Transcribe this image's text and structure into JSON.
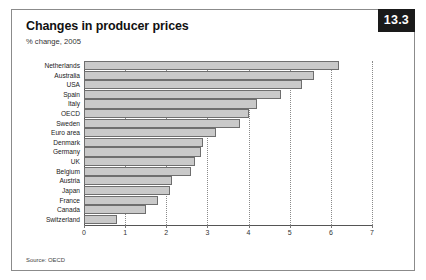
{
  "badge": {
    "label": "13.3"
  },
  "header": {
    "title": "Changes in producer prices",
    "subtitle": "% change, 2005"
  },
  "footer": {
    "source": "Source: OECD"
  },
  "chart_data": {
    "type": "bar",
    "orientation": "horizontal",
    "title": "Changes in producer prices",
    "subtitle": "% change, 2005",
    "xlabel": "",
    "ylabel": "",
    "xlim": [
      0,
      7
    ],
    "xticks": [
      0,
      1,
      2,
      3,
      4,
      5,
      6,
      7
    ],
    "xticklabels": [
      "0",
      "1",
      "2",
      "3",
      "4",
      "5",
      "6",
      "7"
    ],
    "grid": "vertical-dotted",
    "legend": "none",
    "bar_fill": "#c9c9c9",
    "bar_edge": "#6e6e6e",
    "categories": [
      "Netherlands",
      "Australia",
      "USA",
      "Spain",
      "Italy",
      "OECD",
      "Sweden",
      "Euro area",
      "Denmark",
      "Germany",
      "UK",
      "Belgium",
      "Austria",
      "Japan",
      "France",
      "Canada",
      "Switzerland"
    ],
    "values": [
      6.2,
      5.6,
      5.3,
      4.8,
      4.2,
      4.0,
      3.8,
      3.2,
      2.9,
      2.85,
      2.7,
      2.6,
      2.15,
      2.1,
      1.8,
      1.5,
      0.8
    ]
  }
}
